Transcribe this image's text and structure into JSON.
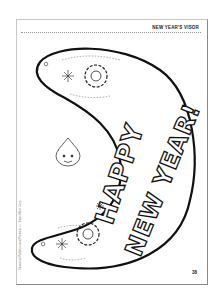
{
  "header": {
    "title": "NEW YEAR'S VISOR"
  },
  "page": {
    "number": "38"
  },
  "side_credit": {
    "text": "Seasonal Patterns and Projects © Evan-Moor Corp."
  },
  "visor": {
    "line1": "HAPPY",
    "line2": "NEW YEAR!",
    "decorations": [
      "snowflake-icon",
      "party-hat-face-icon",
      "streamer-lines",
      "punch-hole-icon"
    ]
  },
  "colors": {
    "ink": "#111111",
    "border": "#8a8a8a",
    "paper": "#ffffff"
  }
}
